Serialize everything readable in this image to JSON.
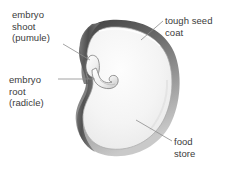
{
  "diagram": {
    "background_color": "#ffffff",
    "text_color": "#3b3b3b",
    "labels": [
      {
        "id": "embryo-shoot",
        "text": "embryo\nshoot\n(pumule)",
        "lines": [
          "embryo",
          "shoot",
          "(pumule)"
        ]
      },
      {
        "id": "embryo-root",
        "text": "embryo\nroot\n(radicle)",
        "lines": [
          "embryo",
          "root",
          "(radicle)"
        ]
      },
      {
        "id": "tough-seed-coat",
        "text": "tough seed\ncoat",
        "lines": [
          "tough seed",
          "coat"
        ]
      },
      {
        "id": "food-store",
        "text": "food\nstore",
        "lines": [
          "food",
          "store"
        ]
      }
    ],
    "parts": {
      "seed_coat_color": "#6e6e6e",
      "seed_coat_dark": "#4a4a4a",
      "food_store_color": "#f2f2f2",
      "embryo_color": "#fbfbfb",
      "leader_line_color": "#8c8c8c"
    }
  }
}
